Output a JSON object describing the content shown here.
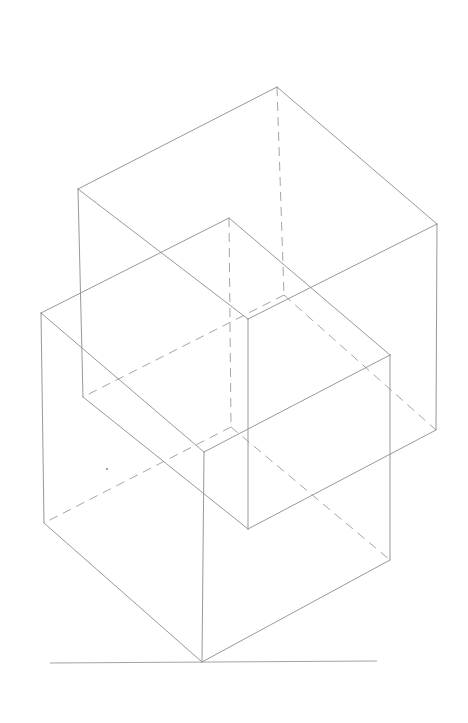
{
  "figure": {
    "stroke_color": "#8c8c8c",
    "background": "#ffffff"
  },
  "cubes": [
    {
      "name": "upper-cube",
      "visible_edges": [
        [
          [
            277,
            87
          ],
          [
            78,
            189
          ]
        ],
        [
          [
            277,
            87
          ],
          [
            437,
            224
          ]
        ],
        [
          [
            78,
            189
          ],
          [
            248,
            319
          ]
        ],
        [
          [
            437,
            224
          ],
          [
            248,
            319
          ]
        ],
        [
          [
            78,
            189
          ],
          [
            83,
            397
          ]
        ],
        [
          [
            437,
            224
          ],
          [
            436,
            430
          ]
        ],
        [
          [
            248,
            319
          ],
          [
            248,
            529
          ]
        ],
        [
          [
            83,
            397
          ],
          [
            248,
            529
          ]
        ],
        [
          [
            436,
            430
          ],
          [
            248,
            529
          ]
        ]
      ],
      "hidden_edges": [
        [
          [
            277,
            87
          ],
          [
            284,
            295
          ]
        ],
        [
          [
            284,
            295
          ],
          [
            83,
            397
          ]
        ],
        [
          [
            284,
            295
          ],
          [
            436,
            430
          ]
        ]
      ]
    },
    {
      "name": "lower-cube",
      "visible_edges": [
        [
          [
            229,
            218
          ],
          [
            41,
            313
          ]
        ],
        [
          [
            229,
            218
          ],
          [
            390,
            355
          ]
        ],
        [
          [
            41,
            313
          ],
          [
            204,
            452
          ]
        ],
        [
          [
            390,
            355
          ],
          [
            204,
            452
          ]
        ],
        [
          [
            41,
            313
          ],
          [
            44,
            523
          ]
        ],
        [
          [
            390,
            355
          ],
          [
            390,
            560
          ]
        ],
        [
          [
            204,
            452
          ],
          [
            202,
            662
          ]
        ],
        [
          [
            44,
            523
          ],
          [
            202,
            662
          ]
        ],
        [
          [
            390,
            560
          ],
          [
            202,
            662
          ]
        ]
      ],
      "hidden_edges": [
        [
          [
            229,
            218
          ],
          [
            231,
            427
          ]
        ],
        [
          [
            231,
            427
          ],
          [
            44,
            523
          ]
        ],
        [
          [
            231,
            427
          ],
          [
            390,
            560
          ]
        ]
      ]
    }
  ],
  "ground_line": [
    [
      50,
      663
    ],
    [
      377,
      661
    ]
  ],
  "stray_marks": [
    [
      107,
      469
    ]
  ]
}
